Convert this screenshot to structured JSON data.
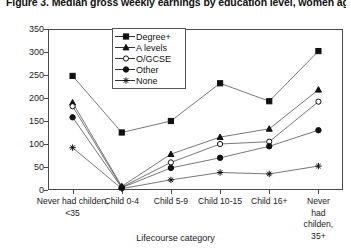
{
  "title": "Figure 3. Median gross weekly earnings by education level, women aged 20-59",
  "axis": {
    "ylabel": "£/week",
    "xlabel": "Lifecourse category",
    "yticks": [
      0,
      50,
      100,
      150,
      200,
      250,
      300,
      350
    ],
    "ylim": [
      0,
      350
    ]
  },
  "legend": {
    "position": "top-center-inside",
    "entries": [
      {
        "label": "Degree+",
        "marker": "filled-square"
      },
      {
        "label": "A levels",
        "marker": "filled-triangle"
      },
      {
        "label": "O/GCSE",
        "marker": "open-circle"
      },
      {
        "label": "Other",
        "marker": "filled-circle"
      },
      {
        "label": "None",
        "marker": "asterisk"
      }
    ]
  },
  "chart_data": {
    "type": "line",
    "title": "Figure 3. Median gross weekly earnings by education level, women aged 20-59",
    "xlabel": "Lifecourse category",
    "ylabel": "£/week",
    "ylim": [
      0,
      350
    ],
    "grid": false,
    "categories": [
      "Never had childen, <35",
      "Child 0-4",
      "Child 5-9",
      "Child 10-15",
      "Child 16+",
      "Never had childen, 35+"
    ],
    "series": [
      {
        "name": "Degree+",
        "marker": "filled-square",
        "values": [
          248,
          125,
          150,
          232,
          193,
          302
        ]
      },
      {
        "name": "A levels",
        "marker": "filled-triangle",
        "values": [
          190,
          8,
          78,
          115,
          133,
          218
        ]
      },
      {
        "name": "O/GCSE",
        "marker": "open-circle",
        "values": [
          182,
          6,
          60,
          100,
          105,
          192
        ]
      },
      {
        "name": "Other",
        "marker": "filled-circle",
        "values": [
          158,
          5,
          48,
          70,
          95,
          130
        ]
      },
      {
        "name": "None",
        "marker": "asterisk",
        "values": [
          92,
          3,
          22,
          38,
          35,
          52
        ]
      }
    ]
  }
}
